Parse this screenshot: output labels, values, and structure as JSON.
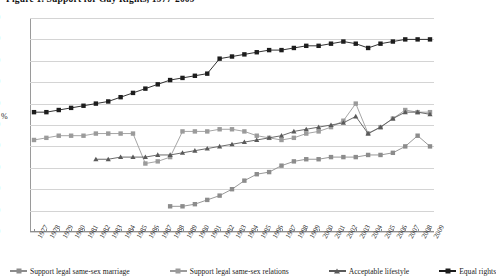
{
  "figure": {
    "title": "Figure 1.  Support for Gay Rights, 1977-2009"
  },
  "chart_data": {
    "type": "line",
    "title": "Figure 1.  Support for Gay Rights, 1977-2009",
    "xlabel": "",
    "ylabel": "%",
    "ylim": [
      0,
      100
    ],
    "ytick_step": 10,
    "grid": true,
    "legend_position": "bottom",
    "x": [
      1977,
      1978,
      1979,
      1980,
      1981,
      1982,
      1983,
      1984,
      1985,
      1986,
      1987,
      1988,
      1989,
      1990,
      1991,
      1992,
      1993,
      1994,
      1995,
      1996,
      1997,
      1998,
      1999,
      2000,
      2001,
      2002,
      2003,
      2004,
      2005,
      2006,
      2007,
      2008,
      2009
    ],
    "yticks": [
      0,
      10,
      20,
      30,
      40,
      50,
      60,
      70,
      80,
      90,
      100
    ],
    "xticklabels": [
      "1977",
      "1978",
      "1979",
      "1980",
      "1981",
      "1982",
      "1983",
      "1984",
      "1985",
      "1986",
      "1987",
      "1988",
      "1989",
      "1990",
      "1991",
      "1992",
      "1993",
      "1994",
      "1995",
      "1996",
      "1997",
      "1998",
      "1999",
      "2000",
      "2001",
      "2002",
      "2003",
      "2004",
      "2005",
      "2006",
      "2007",
      "2008",
      "2009"
    ],
    "series": [
      {
        "name": "Support legal same-sex marriage",
        "marker": "square",
        "color": "#8c8c8c",
        "points": [
          {
            "x": 1988,
            "y": 12
          },
          {
            "x": 1989,
            "y": 12
          },
          {
            "x": 1990,
            "y": 13
          },
          {
            "x": 1991,
            "y": 15
          },
          {
            "x": 1992,
            "y": 17
          },
          {
            "x": 1993,
            "y": 20
          },
          {
            "x": 1994,
            "y": 24
          },
          {
            "x": 1995,
            "y": 27
          },
          {
            "x": 1996,
            "y": 28
          },
          {
            "x": 1997,
            "y": 31
          },
          {
            "x": 1998,
            "y": 33
          },
          {
            "x": 1999,
            "y": 34
          },
          {
            "x": 2000,
            "y": 34
          },
          {
            "x": 2001,
            "y": 35
          },
          {
            "x": 2002,
            "y": 35
          },
          {
            "x": 2003,
            "y": 35
          },
          {
            "x": 2004,
            "y": 36
          },
          {
            "x": 2005,
            "y": 36
          },
          {
            "x": 2006,
            "y": 37
          },
          {
            "x": 2007,
            "y": 40
          },
          {
            "x": 2008,
            "y": 45
          },
          {
            "x": 2009,
            "y": 40
          }
        ]
      },
      {
        "name": "Support legal same-sex relations",
        "marker": "square",
        "color": "#9b9b9b",
        "points": [
          {
            "x": 1977,
            "y": 43
          },
          {
            "x": 1978,
            "y": 44
          },
          {
            "x": 1979,
            "y": 45
          },
          {
            "x": 1980,
            "y": 45
          },
          {
            "x": 1981,
            "y": 45
          },
          {
            "x": 1982,
            "y": 46
          },
          {
            "x": 1983,
            "y": 46
          },
          {
            "x": 1984,
            "y": 46
          },
          {
            "x": 1985,
            "y": 46
          },
          {
            "x": 1986,
            "y": 32
          },
          {
            "x": 1987,
            "y": 33
          },
          {
            "x": 1988,
            "y": 35
          },
          {
            "x": 1989,
            "y": 47
          },
          {
            "x": 1990,
            "y": 47
          },
          {
            "x": 1991,
            "y": 47
          },
          {
            "x": 1992,
            "y": 48
          },
          {
            "x": 1993,
            "y": 48
          },
          {
            "x": 1994,
            "y": 47
          },
          {
            "x": 1995,
            "y": 45
          },
          {
            "x": 1996,
            "y": 44
          },
          {
            "x": 1997,
            "y": 43
          },
          {
            "x": 1998,
            "y": 44
          },
          {
            "x": 1999,
            "y": 46
          },
          {
            "x": 2000,
            "y": 47
          },
          {
            "x": 2001,
            "y": 49
          },
          {
            "x": 2002,
            "y": 52
          },
          {
            "x": 2003,
            "y": 60
          },
          {
            "x": 2004,
            "y": 46
          },
          {
            "x": 2005,
            "y": 49
          },
          {
            "x": 2006,
            "y": 53
          },
          {
            "x": 2007,
            "y": 57
          },
          {
            "x": 2008,
            "y": 56
          },
          {
            "x": 2009,
            "y": 56
          }
        ]
      },
      {
        "name": "Acceptable lifestyle",
        "marker": "triangle",
        "color": "#5a5a5a",
        "points": [
          {
            "x": 1982,
            "y": 34
          },
          {
            "x": 1983,
            "y": 34
          },
          {
            "x": 1984,
            "y": 35
          },
          {
            "x": 1985,
            "y": 35
          },
          {
            "x": 1986,
            "y": 35
          },
          {
            "x": 1987,
            "y": 36
          },
          {
            "x": 1988,
            "y": 36
          },
          {
            "x": 1989,
            "y": 37
          },
          {
            "x": 1990,
            "y": 38
          },
          {
            "x": 1991,
            "y": 39
          },
          {
            "x": 1992,
            "y": 40
          },
          {
            "x": 1993,
            "y": 41
          },
          {
            "x": 1994,
            "y": 42
          },
          {
            "x": 1995,
            "y": 43
          },
          {
            "x": 1996,
            "y": 44
          },
          {
            "x": 1997,
            "y": 45
          },
          {
            "x": 1998,
            "y": 47
          },
          {
            "x": 1999,
            "y": 48
          },
          {
            "x": 2000,
            "y": 49
          },
          {
            "x": 2001,
            "y": 50
          },
          {
            "x": 2002,
            "y": 51
          },
          {
            "x": 2003,
            "y": 54
          },
          {
            "x": 2004,
            "y": 46
          },
          {
            "x": 2005,
            "y": 49
          },
          {
            "x": 2006,
            "y": 53
          },
          {
            "x": 2007,
            "y": 56
          },
          {
            "x": 2008,
            "y": 56
          },
          {
            "x": 2009,
            "y": 55
          }
        ]
      },
      {
        "name": "Equal rights",
        "marker": "square",
        "color": "#1d1d1d",
        "points": [
          {
            "x": 1977,
            "y": 56
          },
          {
            "x": 1978,
            "y": 56
          },
          {
            "x": 1979,
            "y": 57
          },
          {
            "x": 1980,
            "y": 58
          },
          {
            "x": 1981,
            "y": 59
          },
          {
            "x": 1982,
            "y": 60
          },
          {
            "x": 1983,
            "y": 61
          },
          {
            "x": 1984,
            "y": 63
          },
          {
            "x": 1985,
            "y": 65
          },
          {
            "x": 1986,
            "y": 67
          },
          {
            "x": 1987,
            "y": 69
          },
          {
            "x": 1988,
            "y": 71
          },
          {
            "x": 1989,
            "y": 72
          },
          {
            "x": 1990,
            "y": 73
          },
          {
            "x": 1991,
            "y": 74
          },
          {
            "x": 1992,
            "y": 81
          },
          {
            "x": 1993,
            "y": 82
          },
          {
            "x": 1994,
            "y": 83
          },
          {
            "x": 1995,
            "y": 84
          },
          {
            "x": 1996,
            "y": 85
          },
          {
            "x": 1997,
            "y": 85
          },
          {
            "x": 1998,
            "y": 86
          },
          {
            "x": 1999,
            "y": 87
          },
          {
            "x": 2000,
            "y": 87
          },
          {
            "x": 2001,
            "y": 88
          },
          {
            "x": 2002,
            "y": 89
          },
          {
            "x": 2003,
            "y": 88
          },
          {
            "x": 2004,
            "y": 86
          },
          {
            "x": 2005,
            "y": 88
          },
          {
            "x": 2006,
            "y": 89
          },
          {
            "x": 2007,
            "y": 90
          },
          {
            "x": 2008,
            "y": 90
          },
          {
            "x": 2009,
            "y": 90
          }
        ]
      }
    ]
  }
}
